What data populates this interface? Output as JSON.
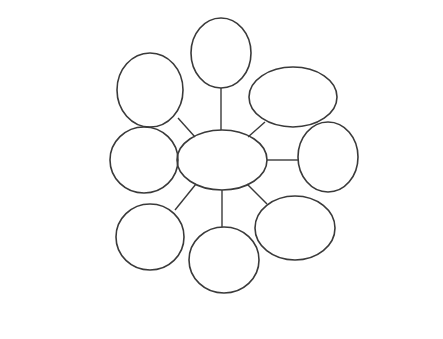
{
  "diagram": {
    "type": "hub-and-spoke mind map",
    "center": {
      "line1": "Applications of",
      "line2": "Polymer",
      "line3": "Nanocomposites"
    },
    "nodes": {
      "energy": {
        "l1": "Energy",
        "l2": "Storage",
        "l3": "&",
        "l4": "Harvesting",
        "items": [
          "Solar cells",
          "Fuel cells",
          "H",
          "2",
          " storage",
          "Piezo harvesters",
          "Battery electrodes"
        ]
      },
      "biomedical": {
        "l1": "Biomedical",
        "l2": "Medicine",
        "l3": "&",
        "l4": "Drugs",
        "items": [
          "Bio sensors",
          "Drug release",
          "Wound healing",
          "Medical implants",
          "Dental applications"
        ]
      },
      "infrastructure": {
        "l1": "Infrastructure",
        "l2": "&",
        "l3": "Civil structures",
        "items": [
          "Buildings & Bridges",
          "Smokestacks",
          "Highway Culverts",
          "Plastic & Rubber"
        ]
      },
      "automobiles": {
        "l1": "Automobiles",
        "l2": "&",
        "l3": "Textiles",
        "items": [
          "Covers & coatings",
          "Tires & Windows",
          "Water &",
          "Oil repellence",
          "Moisture management",
          "Anti Odor &",
          "Flame Retardancy"
        ]
      },
      "defence": {
        "l1": "Defence",
        "l2": "Aerospace",
        "l3": "&",
        "l4": "Safety",
        "items": [
          "Solid state lasers",
          "Military platforms",
          "Deep space missions",
          "Nuclear detection"
        ]
      },
      "food": {
        "l1": "Food",
        "l2": "&",
        "l3": "Agriculture",
        "items": [
          "Bactericide",
          "Food  packing",
          "Food analysis Sensors",
          "Antimicrobial",
          "coatings"
        ]
      },
      "environment": {
        "l1": "Environment",
        "l2": "Remediation",
        "items": [
          "Hyper spectral imaging",
          "Noise reduction",
          "Filtration",
          "Waste water",
          "Heavy metal adsorption",
          "Insect repellent blocking"
        ]
      },
      "electronics": {
        "l1": "Electronics",
        "l2": "&",
        "l3": "Information",
        "l4": "Technology",
        "items": [
          "Ferrofluids",
          "EMI shielding",
          "Nanopigments",
          "Thermal, Sound",
          "& electrical",
          "Insulators"
        ]
      }
    }
  }
}
